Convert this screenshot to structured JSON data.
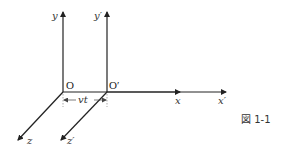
{
  "figure": {
    "caption": "図 1-1"
  },
  "frame_s": {
    "origin_label": "O",
    "x_label": "x",
    "y_label": "y",
    "z_label": "z",
    "origin": [
      63,
      92
    ]
  },
  "frame_s_prime": {
    "origin_label": "O′",
    "x_label": "x′",
    "y_label": "y′",
    "z_label": "z′",
    "origin": [
      107,
      92
    ]
  },
  "displacement": {
    "label": "vt"
  },
  "colors": {
    "axis": "#222222",
    "dashed": "#888888",
    "text": "#333333"
  }
}
